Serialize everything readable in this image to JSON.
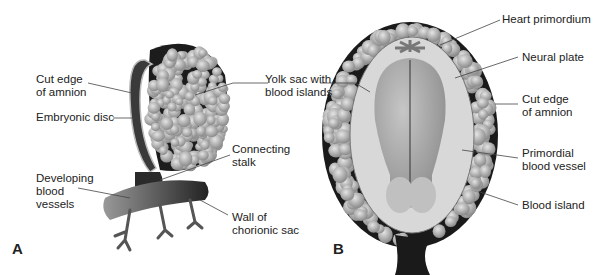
{
  "figure": {
    "panels": [
      {
        "letter": "A",
        "labels": {
          "cut_edge_amnion": "Cut edge\nof amnion",
          "embryonic_disc": "Embryonic disc",
          "yolk_sac": "Yolk sac with\nblood islands",
          "connecting_stalk": "Connecting\nstalk",
          "developing_vessels": "Developing\nblood\nvessels",
          "chorionic_wall": "Wall of\nchorionic sac"
        }
      },
      {
        "letter": "B",
        "labels": {
          "heart_primordium": "Heart primordium",
          "neural_plate": "Neural plate",
          "cut_edge_amnion": "Cut edge\nof amnion",
          "primordial_vessel": "Primordial\nblood vessel",
          "blood_island": "Blood island"
        }
      }
    ],
    "colors": {
      "dark": "#1a1a1a",
      "mid": "#7a7a7a",
      "light": "#c8c8c8",
      "pale": "#dedede"
    }
  }
}
